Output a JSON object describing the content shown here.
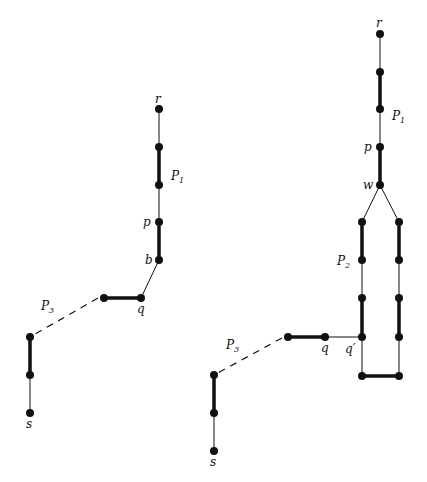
{
  "figures": [
    {
      "id": "left",
      "labels": {
        "r": "r",
        "P1": "P",
        "P1_sub": "1",
        "p": "p",
        "b": "b",
        "q": "q",
        "P3": "P",
        "P3_sub": "3",
        "s": "s"
      }
    },
    {
      "id": "right",
      "labels": {
        "r": "r",
        "P1": "P",
        "P1_sub": "1",
        "p": "p",
        "w": "w",
        "P2": "P",
        "P2_sub": "2",
        "q": "q",
        "qprime": "q′",
        "P3": "P",
        "P3_sub": "3",
        "s": "s"
      }
    }
  ],
  "colors": {
    "ink": "#111111",
    "background": "#ffffff"
  }
}
